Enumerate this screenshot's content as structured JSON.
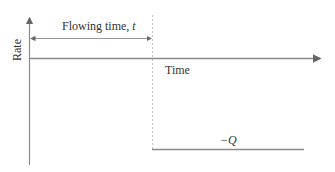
{
  "diagram": {
    "y_axis_label": "Rate",
    "x_axis_label": "Time",
    "interval_label": "Flowing time, ",
    "interval_var": "t",
    "rate_value_label": "−Q",
    "colors": {
      "axis": "#8a8a8a",
      "text": "#333333",
      "dashed": "#bbbbbb",
      "rate_line": "#8a8a8a"
    }
  }
}
